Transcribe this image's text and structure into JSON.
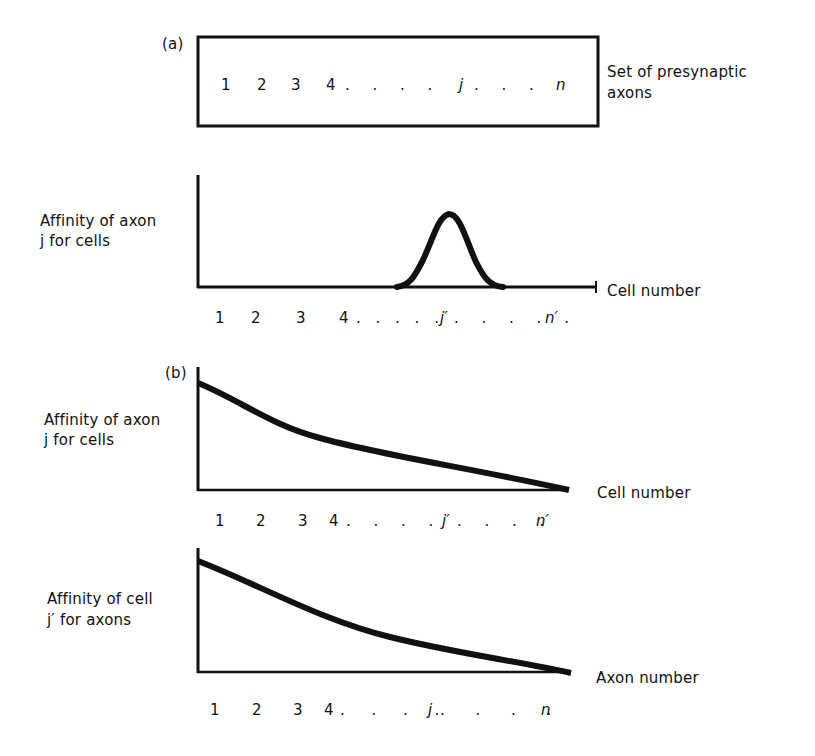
{
  "figure": {
    "panel_a": {
      "tag": "(a)",
      "box": {
        "items": [
          "1",
          "2",
          "3",
          "4",
          ". . . .",
          "j",
          ". . .",
          "n"
        ],
        "label_line1": "Set of presynaptic",
        "label_line2": "axons"
      },
      "plot": {
        "ylabel_line1": "Affinity of axon",
        "ylabel_line2": "j for cells",
        "xlabel": "Cell number",
        "ticks": [
          "1",
          "2",
          "3",
          "4",
          ". . . . .",
          "j′",
          ". . . . .",
          "n′"
        ],
        "curve": "gaussian peak centred at cell j′"
      }
    },
    "panel_b": {
      "tag": "(b)",
      "plot_top": {
        "ylabel_line1": "Affinity of axon",
        "ylabel_line2": "j for cells",
        "xlabel": "Cell number",
        "ticks": [
          "1",
          "2",
          "3",
          "4",
          ". . . .",
          "j′",
          ". . . .",
          "n′"
        ],
        "curve": "monotonic decreasing gradient from cell 1 to n′"
      },
      "plot_bottom": {
        "ylabel_line1": "Affinity of cell",
        "ylabel_line2": "j′ for axons",
        "xlabel": "Axon number",
        "ticks": [
          "1",
          "2",
          "3",
          "4",
          ". . . .",
          "j",
          ". . . .",
          "n"
        ],
        "curve": "monotonic decreasing gradient from axon 1 to n"
      }
    }
  }
}
